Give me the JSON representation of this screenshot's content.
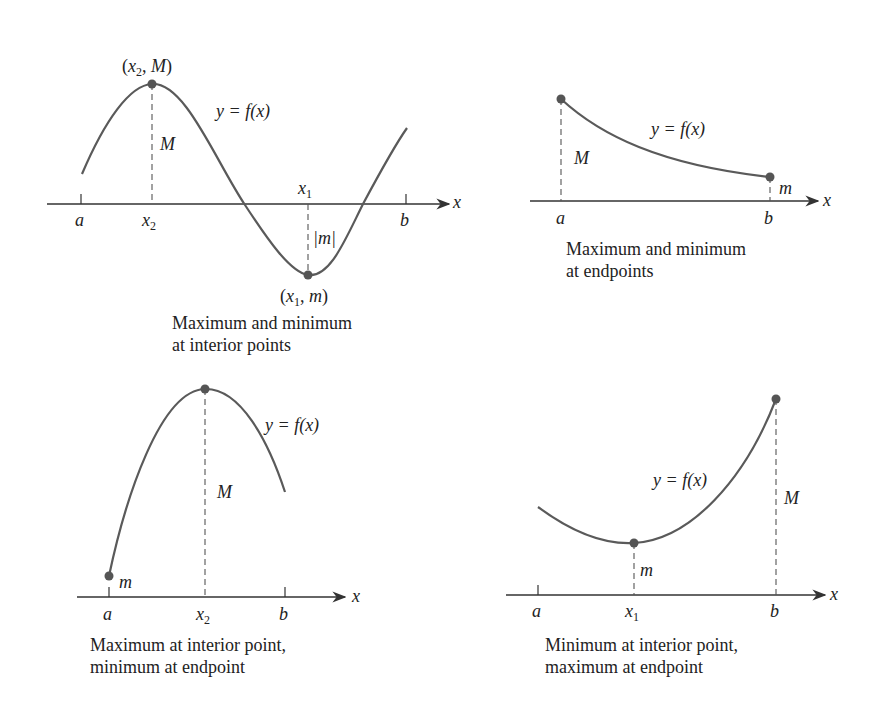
{
  "panels": [
    {
      "id": "top-left",
      "caption_line1": "Maximum and minimum",
      "caption_line2": "at interior points",
      "labels": {
        "max_point": "(x",
        "max_point_sub": "2",
        "max_point_tail": ", M)",
        "min_point": "(x",
        "min_point_sub": "1",
        "min_point_tail": ", m)",
        "func": "y = f(x)",
        "M": "M",
        "abs_m": "|m|",
        "a": "a",
        "b": "b",
        "x2": "x",
        "x2_sub": "2",
        "x1": "x",
        "x1_sub": "1",
        "x_axis": "x"
      }
    },
    {
      "id": "top-right",
      "caption_line1": "Maximum and minimum",
      "caption_line2": "at endpoints",
      "labels": {
        "func": "y = f(x)",
        "M": "M",
        "m": "m",
        "a": "a",
        "b": "b",
        "x_axis": "x"
      }
    },
    {
      "id": "bottom-left",
      "caption_line1": "Maximum at interior point,",
      "caption_line2": "minimum at endpoint",
      "labels": {
        "func": "y = f(x)",
        "M": "M",
        "m": "m",
        "a": "a",
        "b": "b",
        "x2": "x",
        "x2_sub": "2",
        "x_axis": "x"
      }
    },
    {
      "id": "bottom-right",
      "caption_line1": "Minimum at interior point,",
      "caption_line2": "maximum at endpoint",
      "labels": {
        "func": "y = f(x)",
        "M": "M",
        "m": "m",
        "a": "a",
        "b": "b",
        "x1": "x",
        "x1_sub": "1",
        "x_axis": "x"
      }
    }
  ],
  "colors": {
    "curve": "#5a5a5a",
    "dot": "#555555",
    "text": "#222222"
  }
}
